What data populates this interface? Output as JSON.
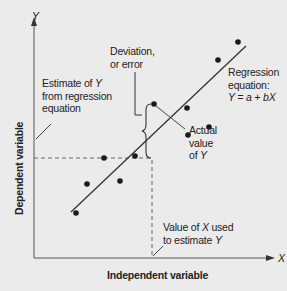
{
  "diagram": {
    "axes": {
      "y_letter": "Y",
      "x_letter": "X",
      "y_title": "Dependent variable",
      "x_title": "Independent variable"
    },
    "annotations": {
      "deviation_line1": "Deviation,",
      "deviation_line2": "or error",
      "estimate_line1": "Estimate of ",
      "estimate_line1_var": "Y",
      "estimate_line2": "from regression",
      "estimate_line3": "equation",
      "regression_line1": "Regression",
      "regression_line2": "equation:",
      "regression_equation": "Y = a + bX",
      "actual_line1": "Actual",
      "actual_line2": "value",
      "actual_line3": "of ",
      "actual_line3_var": "Y",
      "xused_line1": "Value of ",
      "xused_line1_var": "X",
      "xused_line1_end": " used",
      "xused_line2": "to estimate ",
      "xused_line2_var": "Y"
    },
    "points": [
      {
        "x": 76,
        "y": 213
      },
      {
        "x": 87,
        "y": 184
      },
      {
        "x": 104,
        "y": 158
      },
      {
        "x": 120,
        "y": 181
      },
      {
        "x": 135,
        "y": 156
      },
      {
        "x": 153,
        "y": 106
      },
      {
        "x": 187,
        "y": 108
      },
      {
        "x": 188,
        "y": 135
      },
      {
        "x": 209,
        "y": 127
      },
      {
        "x": 218,
        "y": 60
      },
      {
        "x": 238,
        "y": 42
      }
    ],
    "colors": {
      "background": "#ebebeb",
      "ink": "#222222"
    }
  }
}
